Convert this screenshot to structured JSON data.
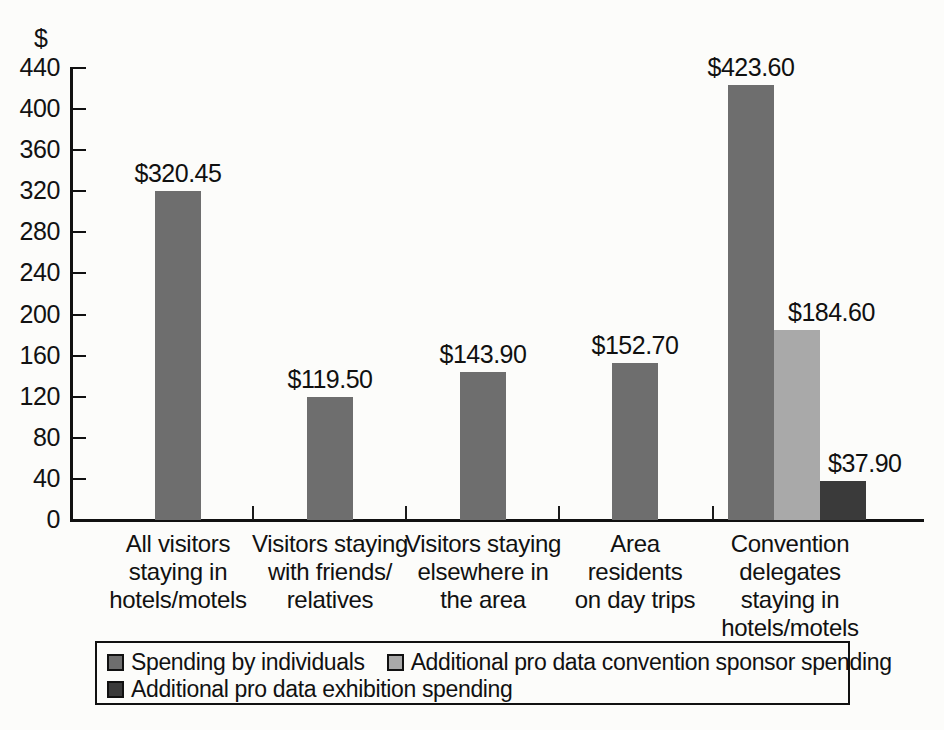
{
  "chart_data": {
    "type": "bar",
    "title": "",
    "subtitle": "",
    "xlabel": "",
    "ylabel": "$",
    "ylim": [
      0,
      440
    ],
    "ytick_step": 40,
    "ytick_labels": [
      "440",
      "400",
      "360",
      "320",
      "280",
      "240",
      "200",
      "160",
      "120",
      "80",
      "40",
      "0"
    ],
    "grid": false,
    "legend_position": "bottom",
    "categories": [
      "All visitors staying in hotels/motels",
      "Visitors staying with friends/relatives",
      "Visitors staying elsewhere in the area",
      "Area residents on day trips",
      "Convention delegates staying in hotels/motels"
    ],
    "category_lines": [
      [
        "All visitors",
        "staying in",
        "hotels/motels"
      ],
      [
        "Visitors staying",
        "with friends/",
        "relatives"
      ],
      [
        "Visitors staying",
        "elsewhere in",
        "the area"
      ],
      [
        "Area",
        "residents",
        "on day trips"
      ],
      [
        "Convention",
        "delegates",
        "staying in",
        "hotels/motels"
      ]
    ],
    "series": [
      {
        "name": "Spending by individuals",
        "color": "#6e6e6e",
        "values": [
          320.45,
          119.5,
          143.9,
          152.7,
          423.6
        ],
        "labels": [
          "$320.45",
          "$119.50",
          "$143.90",
          "$152.70",
          "$423.60"
        ]
      },
      {
        "name": "Additional pro data convention sponsor spending",
        "color": "#a9a9a9",
        "values": [
          null,
          null,
          null,
          null,
          184.6
        ],
        "labels": [
          "",
          "",
          "",
          "",
          "$184.60"
        ]
      },
      {
        "name": "Additional pro data exhibition spending",
        "color": "#3a3a3a",
        "values": [
          null,
          null,
          null,
          null,
          37.9
        ],
        "labels": [
          "",
          "",
          "",
          "",
          "$37.90"
        ]
      }
    ]
  },
  "axis": {
    "y_unit_symbol": "$"
  },
  "legend": {
    "items": [
      {
        "label": "Spending by individuals",
        "color": "#6e6e6e"
      },
      {
        "label": "Additional pro data convention sponsor spending",
        "color": "#a9a9a9"
      },
      {
        "label": "Additional pro data exhibition spending",
        "color": "#3a3a3a"
      }
    ]
  }
}
